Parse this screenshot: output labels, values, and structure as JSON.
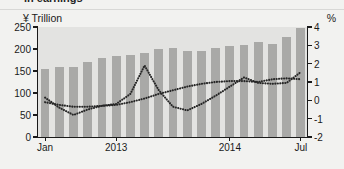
{
  "title": "in earnings",
  "axis": {
    "left_unit": "¥ Trillion",
    "right_unit": "%",
    "left_ticks": [
      "0",
      "50",
      "100",
      "150",
      "200",
      "250"
    ],
    "right_ticks": [
      "-2",
      "-1",
      "0",
      "1",
      "2",
      "3",
      "4"
    ],
    "x_ticks": [
      "Jan",
      "2013",
      "2014",
      "Jul"
    ]
  },
  "chart_data": {
    "type": "bar",
    "title": "in earnings",
    "xlabel": "",
    "ylabel": "¥ Trillion",
    "y2label": "%",
    "ylim": [
      0,
      250
    ],
    "y2lim": [
      -2,
      4
    ],
    "grid": false,
    "legend": "none",
    "categories": [
      "Jan 2013",
      "Feb 2013",
      "Mar 2013",
      "Apr 2013",
      "May 2013",
      "Jun 2013",
      "Jul 2013",
      "Aug 2013",
      "Sep 2013",
      "Oct 2013",
      "Nov 2013",
      "Dec 2013",
      "Jan 2014",
      "Feb 2014",
      "Mar 2014",
      "Apr 2014",
      "May 2014",
      "Jun 2014",
      "Jul 2014"
    ],
    "x_tick_positions": {
      "Jan": 0,
      "2013": 5,
      "2014": 13,
      "Jul": 18
    },
    "series": [
      {
        "name": "Total earnings",
        "type": "bar",
        "axis": "left",
        "unit": "¥ Trillion",
        "values": [
          155,
          160,
          160,
          170,
          180,
          183,
          187,
          192,
          200,
          203,
          195,
          196,
          203,
          207,
          210,
          215,
          212,
          228,
          247
        ]
      },
      {
        "name": "Series A (dotted)",
        "type": "line",
        "style": "dotted",
        "axis": "right",
        "unit": "%",
        "values": [
          -0.1,
          -0.25,
          -0.35,
          -0.35,
          -0.3,
          -0.25,
          -0.1,
          0.1,
          0.35,
          0.55,
          0.75,
          0.9,
          1.0,
          1.05,
          1.05,
          1.0,
          1.15,
          1.2,
          1.15
        ]
      },
      {
        "name": "Series B (dotted)",
        "type": "line",
        "style": "dotted",
        "axis": "right",
        "unit": "%",
        "values": [
          0.15,
          -0.4,
          -0.8,
          -0.5,
          -0.3,
          -0.2,
          0.35,
          1.9,
          0.55,
          -0.35,
          -0.55,
          -0.2,
          0.25,
          0.75,
          1.25,
          0.95,
          0.9,
          0.95,
          1.55
        ]
      }
    ]
  }
}
